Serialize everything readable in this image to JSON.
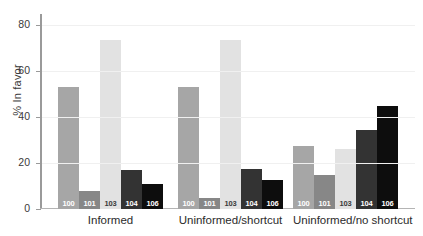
{
  "chart_data": {
    "type": "bar",
    "title": "",
    "xlabel": "",
    "ylabel": "% In favor",
    "ylim": [
      0,
      85
    ],
    "yticks": [
      0,
      20,
      40,
      60,
      80
    ],
    "grid": true,
    "legend": "none",
    "categories": [
      "Informed",
      "Uninformed/shortcut",
      "Uninformed/no shortcut"
    ],
    "series": [
      {
        "name": "100",
        "color": "#a6a6a6",
        "label_color": "#ffffff",
        "values": [
          53,
          53,
          27.5
        ]
      },
      {
        "name": "101",
        "color": "#878787",
        "label_color": "#ffffff",
        "values": [
          8,
          5,
          15
        ]
      },
      {
        "name": "103",
        "color": "#e2e2e2",
        "label_color": "#3a3a3a",
        "values": [
          73.5,
          73.5,
          26
        ]
      },
      {
        "name": "104",
        "color": "#333333",
        "label_color": "#ffffff",
        "values": [
          17,
          17.5,
          34.5
        ]
      },
      {
        "name": "106",
        "color": "#0d0d0d",
        "label_color": "#ffffff",
        "values": [
          11,
          12.5,
          45
        ]
      }
    ]
  }
}
